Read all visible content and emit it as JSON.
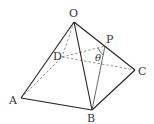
{
  "diagram": {
    "type": "square pyramid",
    "points": {
      "O": {
        "label": "O",
        "x": 74,
        "y": 22,
        "lx": 69,
        "ly": 17
      },
      "A": {
        "label": "A",
        "x": 21,
        "y": 98,
        "lx": 9,
        "ly": 104
      },
      "B": {
        "label": "B",
        "x": 92,
        "y": 110,
        "lx": 87,
        "ly": 122
      },
      "C": {
        "label": "C",
        "x": 135,
        "y": 70,
        "lx": 138,
        "ly": 75
      },
      "D": {
        "label": "D",
        "x": 62,
        "y": 57,
        "lx": 53,
        "ly": 60
      },
      "P": {
        "label": "P",
        "x": 105,
        "y": 46,
        "lx": 106,
        "ly": 43
      }
    },
    "angle_label": {
      "text": "θ",
      "x": 95,
      "y": 61
    },
    "solid_edges": [
      "OA",
      "OB",
      "OC",
      "AB",
      "BC",
      "PB"
    ],
    "dashed_edges": [
      "OD",
      "AD",
      "DC",
      "DP"
    ]
  }
}
